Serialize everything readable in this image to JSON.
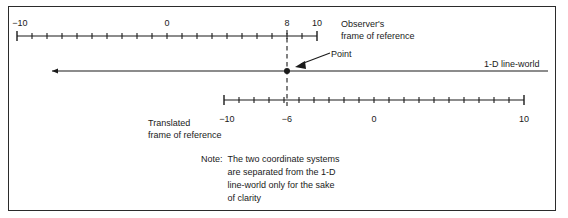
{
  "figure": {
    "border_color": "#2b2b2b",
    "ink_color": "#1a1a1a"
  },
  "line_world": {
    "label": "1-D line-world",
    "x_start": 52,
    "x_end": 548,
    "y": 71,
    "has_left_arrow": true
  },
  "point": {
    "label": "Point",
    "x": 287,
    "y": 71,
    "observer_value": 8,
    "translated_value": -6
  },
  "observer_axis": {
    "caption_line1": "Observer's",
    "caption_line2": "frame of reference",
    "x_left": 17,
    "x_right": 317,
    "y": 36,
    "ticks": 21,
    "labels": [
      {
        "text": "−10",
        "value": -10,
        "x": 17
      },
      {
        "text": "0",
        "value": 0,
        "x": 167
      },
      {
        "text": "8",
        "value": 8,
        "x": 287
      },
      {
        "text": "10",
        "value": 10,
        "x": 317
      }
    ],
    "labels_position": "above"
  },
  "translated_axis": {
    "caption_line1": "Translated",
    "caption_line2": "frame of reference",
    "x_left": 224,
    "x_right": 524,
    "y": 100,
    "ticks": 21,
    "labels": [
      {
        "text": "−10",
        "value": -10,
        "x": 224
      },
      {
        "text": "−6",
        "value": -6,
        "x": 284
      },
      {
        "text": "0",
        "value": 0,
        "x": 374
      },
      {
        "text": "10",
        "value": 10,
        "x": 524
      }
    ],
    "labels_position": "below"
  },
  "note": {
    "prefix": "Note:",
    "line1": "The two coordinate systems",
    "line2": "are separated from the 1-D",
    "line3": "line-world only for the sake",
    "line4": "of clarity"
  }
}
